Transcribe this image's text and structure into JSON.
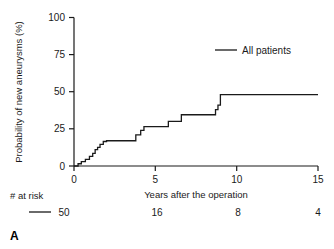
{
  "panel": {
    "label": "A"
  },
  "chart_data": {
    "type": "line",
    "title": "",
    "xlabel": "Years after the operation",
    "ylabel": "Probability of new aneurysms (%)",
    "xlim": [
      0,
      15
    ],
    "ylim": [
      0,
      100
    ],
    "xticks": [
      0,
      5,
      10,
      15
    ],
    "xtick_labels": [
      "0",
      "5",
      "10",
      "15"
    ],
    "yticks": [
      0,
      25,
      50,
      75,
      100
    ],
    "ytick_labels": [
      "0",
      "25",
      "50",
      "75",
      "100"
    ],
    "grid": false,
    "legend_position": "top-right",
    "series": [
      {
        "name": "All patients",
        "step": "post",
        "x": [
          0,
          0.25,
          0.45,
          0.7,
          0.95,
          1.15,
          1.3,
          1.45,
          1.6,
          1.8,
          2.0,
          2.6,
          3.6,
          3.8,
          4.1,
          4.3,
          5.6,
          5.8,
          6.4,
          6.6,
          8.5,
          8.7,
          8.85,
          9.0,
          15
        ],
        "y": [
          0,
          1.5,
          3,
          4.5,
          6.5,
          8.5,
          11,
          12.5,
          14.5,
          16.5,
          17,
          17,
          17,
          21,
          24,
          26.5,
          26.5,
          30,
          30,
          34.5,
          34.5,
          38,
          41,
          48,
          48
        ]
      }
    ],
    "risk_table": {
      "label": "# at risk",
      "times": [
        0,
        5,
        10,
        15
      ],
      "rows": [
        {
          "name": "All patients",
          "counts": [
            "50",
            "16",
            "8",
            "4"
          ]
        }
      ]
    }
  },
  "colors": {
    "curve": "#1a1a1a",
    "axis": "#1a1a1a",
    "text": "#1a1a1a",
    "background": "#ffffff"
  }
}
